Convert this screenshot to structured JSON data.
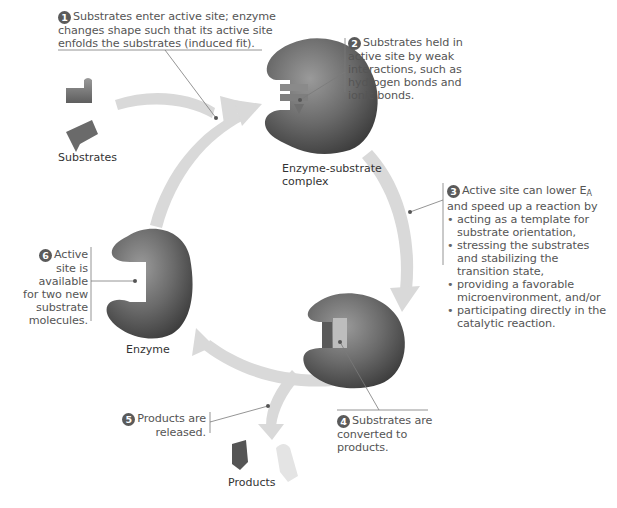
{
  "diagram": {
    "colors": {
      "arrow": "#d6d6d6",
      "enzyme_dark": "#4e4e4e",
      "enzyme_light": "#8a8a8a",
      "substrate": "#7a7a7a",
      "text": "#555555",
      "leader": "#7a7a7a",
      "step_badge": "#5a5a5a"
    },
    "labels": {
      "substrates": "Substrates",
      "complex_line1": "Enzyme-substrate",
      "complex_line2": "complex",
      "enzyme": "Enzyme",
      "products": "Products"
    },
    "steps": [
      {
        "number": "1",
        "lines": [
          "Substrates enter active site; enzyme",
          "changes shape such that its active site",
          "enfolds the substrates (induced fit)."
        ]
      },
      {
        "number": "2",
        "lines": [
          "Substrates held in",
          "active site by weak",
          "interactions, such as",
          "hydrogen bonds and",
          "ionic bonds."
        ]
      },
      {
        "number": "3",
        "intro_line1_pre": "Active site can lower E",
        "intro_line1_sub": "A",
        "intro_line2": "and speed up a reaction by",
        "bullets": [
          {
            "lines": [
              "acting as a template for",
              "substrate orientation,"
            ]
          },
          {
            "lines": [
              "stressing the substrates",
              "and stabilizing the",
              "transition state,"
            ]
          },
          {
            "lines": [
              "providing a favorable",
              "microenvironment, and/or"
            ]
          },
          {
            "lines": [
              "participating directly in the",
              "catalytic reaction."
            ]
          }
        ]
      },
      {
        "number": "4",
        "lines": [
          "Substrates are",
          "converted to",
          "products."
        ]
      },
      {
        "number": "5",
        "lines": [
          "Products are",
          "released."
        ]
      },
      {
        "number": "6",
        "lines": [
          "Active",
          "site is",
          "available",
          "for two new",
          "substrate",
          "molecules."
        ]
      }
    ]
  }
}
